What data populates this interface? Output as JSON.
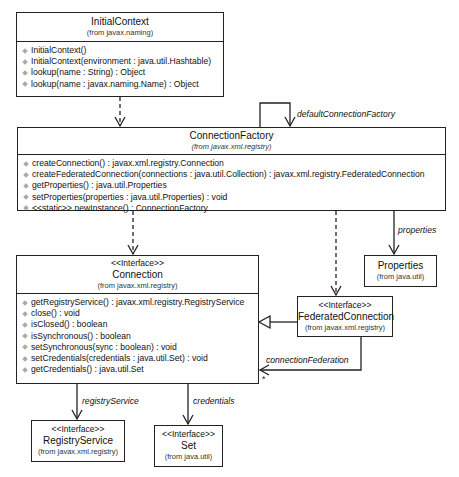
{
  "classes": {
    "initial_context": {
      "name": "InitialContext",
      "package": "(from javax.naming)",
      "operations": [
        "InitialContext()",
        "InitialContext(environment : java.util.Hashtable)",
        "lookup(name : String) : Object",
        "lookup(name : javax.naming.Name) : Object"
      ]
    },
    "connection_factory": {
      "name": "ConnectionFactory",
      "package": "(from javax.xml.registry)",
      "operations": [
        "createConnection() : javax.xml.registry.Connection",
        "createFederatedConnection(connections : java.util.Collection) : javax.xml.registry.FederatedConnection",
        "getProperties() : java.util.Properties",
        "setProperties(properties : java.util.Properties) : void",
        "<<static>> newInstance() : ConnectionFactory"
      ]
    },
    "connection": {
      "stereotype": "<<Interface>>",
      "name": "Connection",
      "package": "(from javax.xml.registry)",
      "operations": [
        "getRegistryService() : javax.xml.registry.RegistryService",
        "close() : void",
        "isClosed() : boolean",
        "isSynchronous() : boolean",
        "setSynchronous(sync : boolean) : void",
        "setCredentials(credentials : java.util.Set) : void",
        "getCredentials() : java.util.Set"
      ]
    },
    "properties": {
      "name": "Properties",
      "package": "(from java.util)"
    },
    "federated_connection": {
      "stereotype": "<<Interface>>",
      "name": "FederatedConnection",
      "package": "(from javax.xml.registry)"
    },
    "registry_service": {
      "stereotype": "<<Interface>>",
      "name": "RegistryService",
      "package": "(from javax.xml.registry)"
    },
    "set": {
      "stereotype": "<<Interface>>",
      "name": "Set",
      "package": "(from java.util)"
    }
  },
  "associations": {
    "default_connection_factory": "defaultConnectionFactory",
    "properties": "properties",
    "connection_federation": "connectionFederation",
    "connection_federation_multiplicity": "*",
    "registry_service": "registryService",
    "credentials": "credentials"
  }
}
